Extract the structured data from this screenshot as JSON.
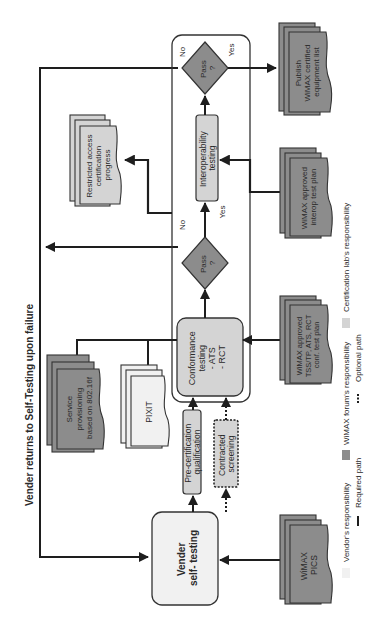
{
  "title": "Vender returns to Self-Testing upon failure",
  "colors": {
    "vendor": "#f1f1f1",
    "forum": "#8c8c8c",
    "lab": "#d4d4d4",
    "line": "#1e1e1e"
  },
  "process": {
    "vender_self_testing": [
      "Vender",
      "self- testing"
    ],
    "pre_certification": [
      "Pre-certification",
      "qualification"
    ],
    "contracted_screening": [
      "Contracted",
      "screening"
    ],
    "conformance": [
      "Conformance",
      "testing",
      "- ATS",
      "- RCT"
    ],
    "pass1": [
      "Pass",
      "?"
    ],
    "pass1_no": "No",
    "pass1_yes": "Yes",
    "interoperability": [
      "Interoperability",
      "testing"
    ],
    "pass2": [
      "Pass",
      "?"
    ],
    "pass2_no": "No",
    "pass2_yes": "Yes"
  },
  "documents": {
    "wimax_pics": [
      "WiMAX",
      "PICS"
    ],
    "conf_test_plan": [
      "WiMAX approved",
      "TSS/TP, ATS, RCT",
      "conf. test plan"
    ],
    "interop_test_plan": [
      "WiMAX approved",
      "interop test plan"
    ],
    "publish_list": [
      "Publish",
      "WiMAX certified",
      "equipment list"
    ],
    "service_provisioning": [
      "Service",
      "provisioning",
      "based on 802.16f"
    ],
    "pixit": [
      "PIXIT"
    ],
    "restricted_access": [
      "Restricted access",
      "certification",
      "progress"
    ]
  },
  "legend": {
    "vendor": "Vendor's responsibility",
    "forum": "WiMAX forum's responsibility",
    "lab": "Certification lab's responsibility",
    "required": "Required path",
    "optional": "Optional path"
  }
}
